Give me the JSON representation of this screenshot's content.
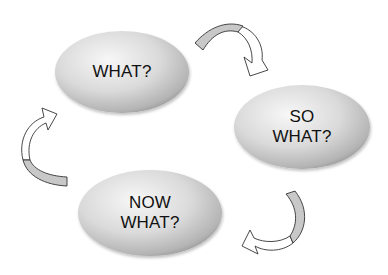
{
  "diagram": {
    "type": "cycle",
    "nodes": [
      {
        "id": "what",
        "lines": [
          "WHAT?"
        ],
        "cx": 122,
        "cy": 72,
        "rx": 68,
        "ry": 42
      },
      {
        "id": "so-what",
        "lines": [
          "SO",
          "WHAT?"
        ],
        "cx": 302,
        "cy": 127,
        "rx": 68,
        "ry": 42
      },
      {
        "id": "now-what",
        "lines": [
          "NOW",
          "WHAT?"
        ],
        "cx": 150,
        "cy": 213,
        "rx": 72,
        "ry": 44
      }
    ],
    "edges": [
      {
        "from": "what",
        "to": "so-what"
      },
      {
        "from": "so-what",
        "to": "now-what"
      },
      {
        "from": "now-what",
        "to": "what"
      }
    ],
    "colors": {
      "ellipse_light": "#f4f4f4",
      "ellipse_mid": "#d6d6d6",
      "ellipse_dark": "#a8a8a8",
      "arrow_band": "#c8c8c8",
      "arrow_outline": "#333333",
      "text": "#111111"
    }
  }
}
